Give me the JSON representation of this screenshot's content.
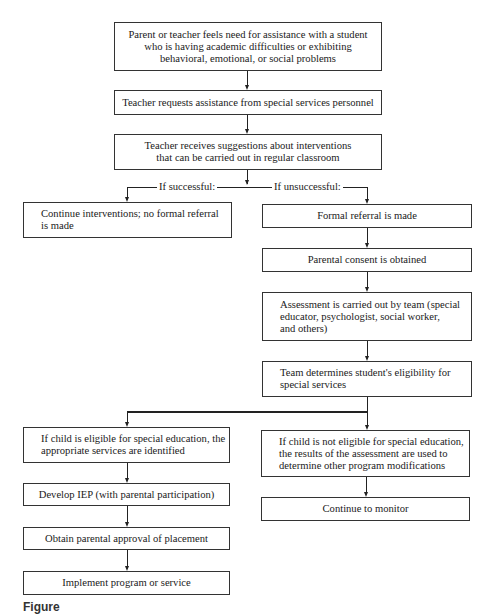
{
  "flowchart": {
    "steps": {
      "need": "Parent or teacher feels need for assistance with a student who is having academic difficulties or exhibiting behavioral, emotional, or social problems",
      "request": "Teacher requests assistance from special services personnel",
      "suggestions": "Teacher receives suggestions about interventions that can be carried out in regular classroom",
      "continue_interventions": "Continue interventions; no formal referral is made",
      "formal_referral": "Formal referral is made",
      "parental_consent": "Parental consent is obtained",
      "assessment": "Assessment is carried out by team (special educator, psychologist, social worker, and others)",
      "eligibility": "Team determines student's eligibility for special services",
      "eligible": "If child is eligible for special education, the appropriate services are identified",
      "not_eligible": "If child is not eligible for special education, the results of the assessment are used to determine other program modifications",
      "develop_iep": "Develop IEP (with parental participation)",
      "parental_approval": "Obtain parental approval of placement",
      "implement": "Implement program or service",
      "continue_monitor": "Continue to monitor"
    },
    "branch_labels": {
      "successful": "If successful:",
      "unsuccessful": "If unsuccessful:"
    },
    "lines": {
      "need": [
        "Parent or teacher feels need for assistance with a student",
        "who is having academic difficulties or exhibiting",
        "behavioral, emotional, or social problems"
      ],
      "suggestions": [
        "Teacher receives suggestions about interventions",
        "that can be carried out in regular classroom"
      ],
      "continue_interventions": [
        "Continue interventions; no formal referral",
        "is made"
      ],
      "assessment": [
        "Assessment is carried out by team (special",
        "educator, psychologist, social worker,",
        "and others)"
      ],
      "eligibility": [
        "Team determines student's eligibility for",
        "special services"
      ],
      "eligible": [
        "If child is eligible for special education, the",
        "appropriate services are identified"
      ],
      "not_eligible": [
        "If child is not eligible for special education,",
        "the results of the assessment are used to",
        "determine other program modifications"
      ]
    }
  },
  "caption": {
    "visible_fragment": "Figure"
  },
  "colors": {
    "line": "#222222",
    "border": "#333333",
    "background": "#ffffff"
  }
}
